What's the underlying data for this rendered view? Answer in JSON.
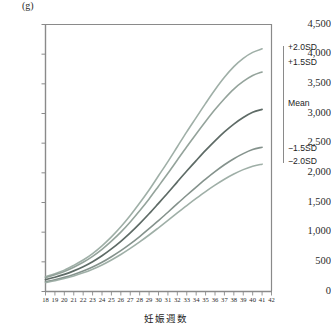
{
  "chart_data": {
    "type": "line",
    "title": "",
    "subtitle": "",
    "unit_label": "(g)",
    "xlabel": "妊娠週数",
    "ylabel": "",
    "xlim": [
      18,
      42
    ],
    "ylim": [
      0,
      4500
    ],
    "grid": false,
    "legend_position": "right",
    "x_tick_labels": [
      "18",
      "19",
      "20",
      "21",
      "22",
      "23",
      "24",
      "25",
      "26",
      "27",
      "28",
      "29",
      "30",
      "31",
      "32",
      "33",
      "34",
      "35",
      "36",
      "37",
      "38",
      "39",
      "40",
      "41",
      "42"
    ],
    "y_tick_labels": [
      "0",
      "500",
      "1,000",
      "1,500",
      "2,000",
      "2,500",
      "3,000",
      "3,500",
      "4,000",
      "4,500"
    ],
    "y_tick_values": [
      0,
      500,
      1000,
      1500,
      2000,
      2500,
      3000,
      3500,
      4000,
      4500
    ],
    "x": [
      18,
      19,
      20,
      21,
      22,
      23,
      24,
      25,
      26,
      27,
      28,
      29,
      30,
      31,
      32,
      33,
      34,
      35,
      36,
      37,
      38,
      39,
      40,
      41
    ],
    "series": [
      {
        "name": "+2.0SD",
        "label": "+2.0SD",
        "color": "#9aaba2",
        "values": [
          250,
          300,
          360,
          440,
          530,
          640,
          770,
          920,
          1090,
          1280,
          1490,
          1710,
          1950,
          2190,
          2440,
          2690,
          2930,
          3170,
          3400,
          3610,
          3790,
          3930,
          4030,
          4090
        ]
      },
      {
        "name": "+1.5SD",
        "label": "+1.5SD",
        "color": "#8e9e96",
        "values": [
          235,
          282,
          338,
          410,
          492,
          592,
          710,
          848,
          1000,
          1172,
          1360,
          1560,
          1775,
          1992,
          2216,
          2440,
          2656,
          2866,
          3066,
          3250,
          3412,
          3540,
          3640,
          3700
        ]
      },
      {
        "name": "Mean",
        "label": "Mean",
        "color": "#5e6b66",
        "values": [
          200,
          240,
          288,
          348,
          418,
          502,
          602,
          718,
          846,
          988,
          1144,
          1310,
          1486,
          1664,
          1848,
          2030,
          2206,
          2378,
          2540,
          2690,
          2822,
          2932,
          3020,
          3070
        ]
      },
      {
        "name": "-1.5SD",
        "label": "−1.5SD",
        "color": "#7d8c86",
        "values": [
          165,
          198,
          238,
          286,
          344,
          412,
          492,
          586,
          688,
          802,
          926,
          1058,
          1196,
          1336,
          1480,
          1622,
          1760,
          1894,
          2020,
          2136,
          2238,
          2324,
          2392,
          2432
        ]
      },
      {
        "name": "-2.0SD",
        "label": "−2.0SD",
        "color": "#9aaba2",
        "values": [
          152,
          182,
          218,
          262,
          314,
          376,
          448,
          532,
          624,
          726,
          836,
          952,
          1074,
          1198,
          1324,
          1448,
          1568,
          1684,
          1792,
          1892,
          1980,
          2054,
          2112,
          2146
        ]
      }
    ]
  },
  "axis": {
    "unit": "(g)",
    "x_title": "妊娠週数"
  }
}
